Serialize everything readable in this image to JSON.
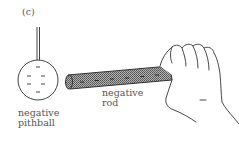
{
  "figure": {
    "panel_label": "(c)",
    "pithball": {
      "label_line1": "negative",
      "label_line2": "pithball",
      "charge_sign": "-",
      "charge_count": 5
    },
    "rod": {
      "label_line1": "negative",
      "label_line2": "rod",
      "charge_sign": "-",
      "charge_count": 5
    },
    "hand": {
      "description": "hand holding rod"
    }
  },
  "colors": {
    "line": "#444444",
    "rod_fill": "#8a8a8a",
    "text": "#555555"
  }
}
